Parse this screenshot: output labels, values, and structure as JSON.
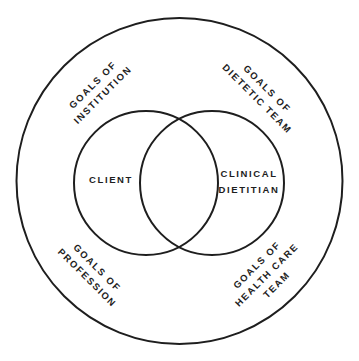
{
  "diagram": {
    "type": "nested-venn",
    "colors": {
      "stroke": "#1e1e1e",
      "background": "#ffffff",
      "text": "#1e1e1e"
    },
    "outer_circle": {
      "label_quadrants": {
        "top_left": {
          "lines": [
            "GOALS OF",
            "INSTITUTION"
          ]
        },
        "top_right": {
          "lines": [
            "GOALS OF",
            "DIETETIC TEAM"
          ]
        },
        "bottom_left": {
          "lines": [
            "GOALS OF",
            "PROFESSION"
          ]
        },
        "bottom_right": {
          "lines": [
            "GOALS OF",
            "HEALTH CARE",
            "TEAM"
          ]
        }
      }
    },
    "inner_circles": {
      "left": {
        "lines": [
          "CLIENT"
        ]
      },
      "right": {
        "lines": [
          "CLINICAL",
          "DIETITIAN"
        ]
      }
    }
  }
}
